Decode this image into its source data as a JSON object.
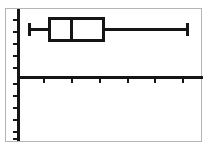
{
  "figure": {
    "background_color": "#ffffff",
    "frame_color": "#b4b4b4",
    "ink_color": "#151515"
  },
  "chart_data": {
    "type": "box",
    "title": "",
    "subtitle": "",
    "xlabel": "",
    "ylabel": "",
    "legend": [],
    "annotations": [],
    "grid": false,
    "orientation": "horizontal",
    "axes": {
      "x_axis": {
        "visible": true,
        "tick_labels": [],
        "tick_count": 6,
        "tick_positions_px": [
          44,
          72,
          100,
          128,
          155,
          183
        ],
        "tick_direction": "outward-below",
        "spine_y_px": 77,
        "spine_x_start_px": 18,
        "spine_x_end_px": 203
      },
      "y_axis": {
        "visible": true,
        "tick_labels": [],
        "tick_count": 11,
        "tick_positions_px": [
          20,
          32,
          44,
          56,
          68,
          84,
          96,
          108,
          120,
          132,
          139
        ],
        "tick_direction": "outward-left",
        "spine_x_px": 18,
        "spine_y_start_px": 9,
        "spine_y_end_px": 141
      }
    },
    "boxes": [
      {
        "name": "series-1",
        "center_px": 29,
        "whisker_low_px": 28,
        "q1_px": 48,
        "median_px": 70,
        "q3_px": 105,
        "whisker_high_px": 188,
        "box_top_px": 17,
        "box_bottom_px": 42,
        "cap_top_px": 23,
        "cap_bottom_px": 36,
        "outliers": []
      }
    ]
  }
}
